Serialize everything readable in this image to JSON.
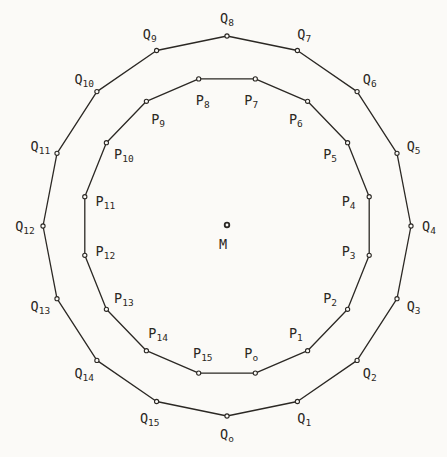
{
  "figure": {
    "background_color": "#fbfaf7",
    "line_color": "#2b2824",
    "cx": 227,
    "cy": 226,
    "center": {
      "label": "M",
      "x": 227,
      "y": 225,
      "label_dx": -4,
      "label_dy": 19
    },
    "polygons": [
      {
        "id": "outer",
        "letter": "Q",
        "sides": 16,
        "radius_x": 184,
        "radius_y": 190,
        "rotation_deg": 0,
        "label_placement": "outside",
        "label_offset": 18,
        "subscripts": [
          "o",
          "1",
          "2",
          "3",
          "4",
          "5",
          "6",
          "7",
          "8",
          "9",
          "10",
          "11",
          "12",
          "13",
          "14",
          "15"
        ]
      },
      {
        "id": "inner",
        "letter": "P",
        "sides": 16,
        "radius_x": 145,
        "radius_y": 150,
        "rotation_deg": 11.25,
        "label_placement": "inside",
        "label_offset": 21,
        "subscripts": [
          "o",
          "1",
          "2",
          "3",
          "4",
          "5",
          "6",
          "7",
          "8",
          "9",
          "10",
          "11",
          "12",
          "13",
          "14",
          "15"
        ]
      }
    ],
    "style": {
      "edge_stroke_width": 1.3,
      "vertex_dot_radius": 2.1,
      "vertex_dot_stroke_width": 1.1,
      "center_dot_radius": 2.3,
      "center_dot_stroke_width": 1.8,
      "subscript_dy": 4
    }
  }
}
